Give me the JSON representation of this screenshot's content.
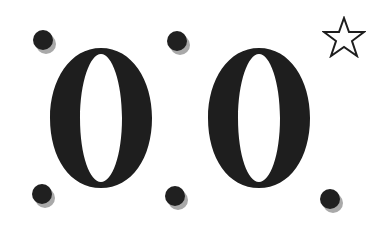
{
  "figure": {
    "glyphs": [
      {
        "char": "0",
        "role": "left-digit"
      },
      {
        "char": "0",
        "role": "right-digit"
      }
    ],
    "trailing_mark": ".",
    "star_symbol": "☆",
    "colors": {
      "background": "#ffffff",
      "ink": "#1e1e1e",
      "dot_shadow": "#a9a9a9"
    }
  }
}
